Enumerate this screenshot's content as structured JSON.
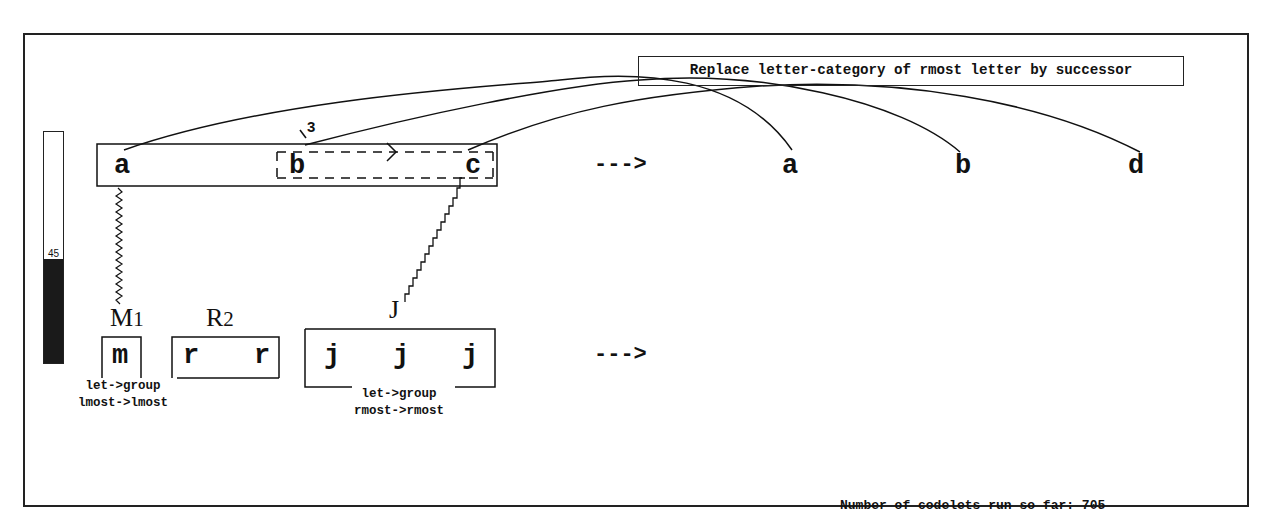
{
  "rule": {
    "text": "Replace letter-category of rmost letter by successor"
  },
  "temperature": {
    "value": "45",
    "percent": 45
  },
  "initial_string": {
    "letters": [
      "a",
      "b",
      "c"
    ]
  },
  "modified_string": {
    "letters": [
      "a",
      "b",
      "d"
    ]
  },
  "target_string": {
    "groups": [
      {
        "label": "M",
        "subscript": "1",
        "letters": [
          "m"
        ]
      },
      {
        "label": "R",
        "subscript": "2",
        "letters": [
          "r",
          "r"
        ]
      },
      {
        "label": "J",
        "subscript": "",
        "letters": [
          "j",
          "j",
          "j"
        ]
      }
    ]
  },
  "bond": {
    "strength": "3"
  },
  "arrows": {
    "top": "--->",
    "bottom": "--->"
  },
  "descriptions": {
    "m_group": [
      "let->group",
      "lmost->lmost"
    ],
    "j_group": [
      "let->group",
      "rmost->rmost"
    ]
  },
  "footer": {
    "label": "Number of codelets run so far:",
    "count": "705"
  },
  "colors": {
    "ink": "#111111",
    "background": "#ffffff",
    "temp_fill": "#1a1a1a"
  }
}
